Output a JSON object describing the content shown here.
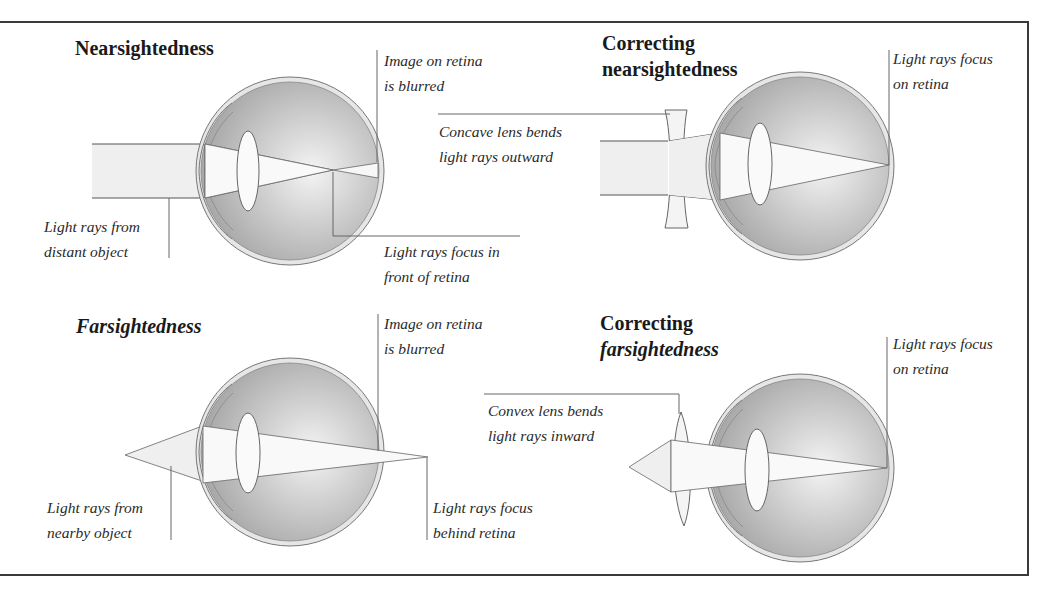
{
  "panels": {
    "nearsightedness": {
      "title": "Nearsightedness",
      "labels": {
        "retina_blurred": [
          "Image on retina",
          "is blurred"
        ],
        "source": [
          "Light rays from",
          "distant object"
        ],
        "focus": [
          "Light rays focus in",
          "front of retina"
        ]
      }
    },
    "correcting_nearsightedness": {
      "title": [
        "Correcting",
        "nearsightedness"
      ],
      "labels": {
        "focus": [
          "Light rays focus",
          "on retina"
        ],
        "lens": [
          "Concave lens bends",
          "light rays outward"
        ]
      }
    },
    "farsightedness": {
      "title": "Farsightedness",
      "labels": {
        "retina_blurred": [
          "Image on retina",
          "is blurred"
        ],
        "source": [
          "Light rays from",
          "nearby object"
        ],
        "focus": [
          "Light rays focus",
          "behind retina"
        ]
      }
    },
    "correcting_farsightedness": {
      "title": [
        "Correcting",
        "farsightedness"
      ],
      "labels": {
        "focus": [
          "Light rays focus",
          "on retina"
        ],
        "lens": [
          "Convex lens bends",
          "light rays inward"
        ]
      }
    }
  },
  "colors": {
    "frame": "#3a3a3a",
    "eye_fill": "#b9b9b9",
    "eye_highlight": "#f2f2f2",
    "ray_fill": "#ececec",
    "line": "#555555",
    "text": "#2a2a2a"
  }
}
